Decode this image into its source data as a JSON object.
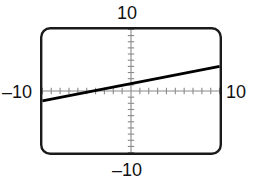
{
  "figure": {
    "kind": "graphing-calculator-screen",
    "bezel_color": "#1a1a1a",
    "screen_background": "#ffffff"
  },
  "labels": {
    "y_max": "10",
    "y_min": "–10",
    "x_min": "–10",
    "x_max": "10"
  },
  "chart_data": {
    "type": "line",
    "title": "",
    "subtitle": "",
    "xlabel": "",
    "ylabel": "",
    "xlim": [
      -10,
      10
    ],
    "ylim": [
      -10,
      10
    ],
    "xscl": 1,
    "yscl": 1,
    "grid": false,
    "legend": null,
    "axes": {
      "x_axis_at_y": 0,
      "y_axis_at_x": 0,
      "tick_marks": true,
      "tick_count_per_half_axis": 10,
      "axis_color": "#8a8a8a",
      "tick_color": "#8a8a8a"
    },
    "series": [
      {
        "name": "line",
        "color": "#000000",
        "line_width": 2.6,
        "equation": "y = 0.28x + 1.2",
        "slope": 0.28,
        "intercept": 1.2,
        "x_intercept": -4.3,
        "x": [
          -10,
          10
        ],
        "y": [
          -1.6,
          4.0
        ]
      }
    ],
    "annotations": [
      {
        "text": "10",
        "position": "top",
        "value": 10
      },
      {
        "text": "–10",
        "position": "bottom",
        "value": -10
      },
      {
        "text": "–10",
        "position": "left",
        "value": -10
      },
      {
        "text": "10",
        "position": "right",
        "value": 10
      }
    ]
  }
}
